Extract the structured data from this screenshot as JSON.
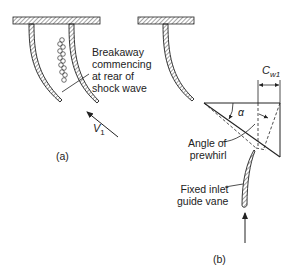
{
  "figure": {
    "panel_a": {
      "caption": "(a)",
      "annotation_lines": [
        "Breakaway",
        "commencing",
        "at rear of",
        "shock wave"
      ],
      "velocity_label": "V",
      "velocity_subscript": "1"
    },
    "panel_b": {
      "caption": "(b)",
      "whirl_label": "C",
      "whirl_subscript": "w1",
      "angle_symbol": "α",
      "prewhirl_lines": [
        "Angle of",
        "prewhirl"
      ],
      "guide_vane_lines": [
        "Fixed inlet",
        "guide vane"
      ]
    }
  },
  "colors": {
    "ink": "#222222",
    "background": "#ffffff",
    "hatch": "#555555"
  }
}
